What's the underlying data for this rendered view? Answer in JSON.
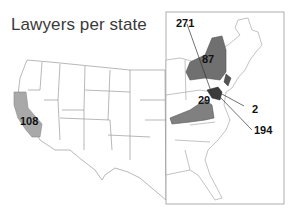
{
  "title": "Lawyers per state",
  "colors": {
    "highlight_light": "#a9a9a9",
    "highlight_dark": "#6e6e6e",
    "darkest": "#3c3c3c",
    "border": "#999999"
  },
  "states": [
    {
      "state": "California",
      "value": "108"
    },
    {
      "state": "New York",
      "value": "87"
    },
    {
      "state": "Virginia",
      "value": "29"
    },
    {
      "state": "District of Columbia",
      "value": "271"
    },
    {
      "state": "Delaware",
      "value": "2"
    },
    {
      "state": "Maryland",
      "value": "194"
    }
  ]
}
